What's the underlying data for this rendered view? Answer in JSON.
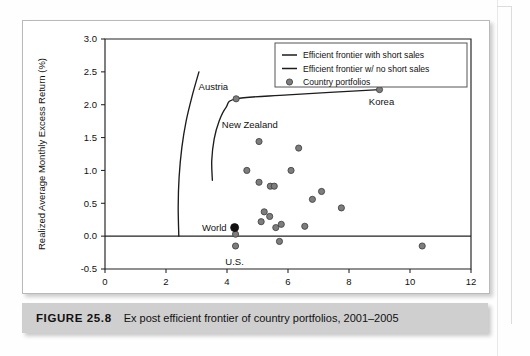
{
  "caption": {
    "label": "FIGURE 25.8",
    "text": "Ex post efficient frontier of country portfolios, 2001–2005"
  },
  "chart_data": {
    "type": "scatter",
    "title": "",
    "xlabel": "Standard Deviation (% per month)",
    "ylabel": "Realized Average Monthly Excess Return (%)",
    "xlim": [
      0,
      12
    ],
    "ylim": [
      -0.5,
      3.0
    ],
    "xticks": [
      0,
      2,
      4,
      6,
      8,
      10,
      12
    ],
    "xticklabels": [
      "0",
      "2",
      "4",
      "6",
      "8",
      "10",
      "12"
    ],
    "yticks": [
      -0.5,
      0.0,
      0.5,
      1.0,
      1.5,
      2.0,
      2.5,
      3.0
    ],
    "yticklabels": [
      "-0.5",
      "0.0",
      "0.5",
      "1.0",
      "1.5",
      "2.0",
      "2.5",
      "3.0"
    ],
    "grid": false,
    "zero_line": true,
    "legend_position": "top-right",
    "legend": [
      {
        "label": "Efficient frontier with short sales",
        "marker": "line"
      },
      {
        "label": "Efficient frontier w/ no short sales",
        "marker": "line"
      },
      {
        "label": "Country portfolios",
        "marker": "circle"
      }
    ],
    "series": [
      {
        "name": "Country portfolios",
        "marker": "circle",
        "color": "#7d7d7d",
        "points": [
          {
            "x": 4.3,
            "y": 2.09,
            "label": "Austria"
          },
          {
            "x": 9.0,
            "y": 2.23,
            "label": "Korea"
          },
          {
            "x": 5.05,
            "y": 1.44,
            "label": ""
          },
          {
            "x": 6.35,
            "y": 1.34,
            "label": ""
          },
          {
            "x": 4.65,
            "y": 1.0,
            "label": ""
          },
          {
            "x": 6.1,
            "y": 1.0,
            "label": ""
          },
          {
            "x": 5.05,
            "y": 0.82,
            "label": ""
          },
          {
            "x": 5.42,
            "y": 0.76,
            "label": ""
          },
          {
            "x": 5.55,
            "y": 0.76,
            "label": ""
          },
          {
            "x": 7.1,
            "y": 0.68,
            "label": ""
          },
          {
            "x": 6.8,
            "y": 0.56,
            "label": ""
          },
          {
            "x": 7.75,
            "y": 0.43,
            "label": ""
          },
          {
            "x": 5.22,
            "y": 0.37,
            "label": ""
          },
          {
            "x": 5.4,
            "y": 0.3,
            "label": ""
          },
          {
            "x": 5.12,
            "y": 0.22,
            "label": ""
          },
          {
            "x": 5.78,
            "y": 0.18,
            "label": ""
          },
          {
            "x": 5.6,
            "y": 0.13,
            "label": ""
          },
          {
            "x": 6.55,
            "y": 0.15,
            "label": ""
          },
          {
            "x": 4.28,
            "y": 0.03,
            "label": ""
          },
          {
            "x": 4.28,
            "y": -0.15,
            "label": "U.S."
          },
          {
            "x": 5.72,
            "y": -0.08,
            "label": ""
          },
          {
            "x": 10.4,
            "y": -0.15,
            "label": ""
          }
        ]
      },
      {
        "name": "World",
        "marker": "filled-circle",
        "color": "#111111",
        "points": [
          {
            "x": 4.25,
            "y": 0.13,
            "label": "World"
          }
        ]
      },
      {
        "name": "Efficient frontier with short sales",
        "marker": "line",
        "color": "#1c1c1c",
        "points": [
          {
            "x": 2.42,
            "y": 0.0
          },
          {
            "x": 2.4,
            "y": 0.45
          },
          {
            "x": 2.43,
            "y": 0.9
          },
          {
            "x": 2.52,
            "y": 1.35
          },
          {
            "x": 2.66,
            "y": 1.75
          },
          {
            "x": 2.85,
            "y": 2.12
          },
          {
            "x": 3.08,
            "y": 2.5
          }
        ]
      },
      {
        "name": "Efficient frontier w/ no short sales",
        "marker": "line",
        "color": "#1c1c1c",
        "points": [
          {
            "x": 3.52,
            "y": 0.85
          },
          {
            "x": 3.5,
            "y": 1.15
          },
          {
            "x": 3.58,
            "y": 1.48
          },
          {
            "x": 3.74,
            "y": 1.75
          },
          {
            "x": 3.97,
            "y": 1.96
          },
          {
            "x": 4.3,
            "y": 2.09
          },
          {
            "x": 6.0,
            "y": 2.15
          },
          {
            "x": 9.0,
            "y": 2.23
          }
        ]
      }
    ],
    "annotations": [
      {
        "text": "Austria",
        "x": 4.3,
        "y": 2.09
      },
      {
        "text": "New Zealand",
        "x": 3.7,
        "y": 1.55
      },
      {
        "text": "Korea",
        "x": 9.0,
        "y": 2.23
      },
      {
        "text": "World",
        "x": 4.25,
        "y": 0.13
      },
      {
        "text": "U.S.",
        "x": 4.28,
        "y": -0.15
      }
    ]
  }
}
